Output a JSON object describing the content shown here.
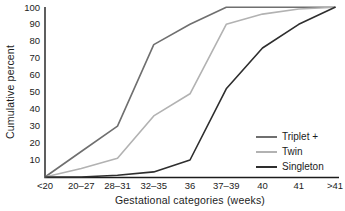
{
  "chart_data": {
    "type": "line",
    "title": "",
    "xlabel": "Gestational categories (weeks)",
    "ylabel": "Cumulative percent",
    "categories": [
      "<20",
      "20–27",
      "28–31",
      "32–35",
      "36",
      "37–39",
      "40",
      "41",
      ">41"
    ],
    "y_ticks": [
      10,
      20,
      30,
      40,
      50,
      60,
      70,
      80,
      90,
      100
    ],
    "ylim": [
      0,
      100
    ],
    "grid": false,
    "legend_position": "bottom-right",
    "axis_color": "#1c1c1c",
    "background_color": "#ffffff",
    "series": [
      {
        "name": "Triplet +",
        "color": "#6f6f6f",
        "values": [
          0,
          15,
          30,
          78,
          90,
          100,
          100,
          100,
          100
        ]
      },
      {
        "name": "Twin",
        "color": "#b2b2b2",
        "values": [
          0,
          5,
          11,
          36,
          49,
          90,
          96,
          99,
          100
        ]
      },
      {
        "name": "Singleton",
        "color": "#2e2e2e",
        "values": [
          0,
          0,
          1,
          3,
          10,
          52,
          76,
          90,
          100
        ]
      }
    ]
  }
}
